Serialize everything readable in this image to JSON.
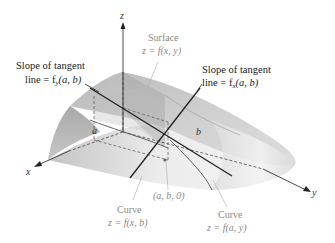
{
  "figure": {
    "axes": {
      "x_label": "x",
      "y_label": "y",
      "z_label": "z"
    },
    "points": {
      "a_label": "a",
      "b_label": "b",
      "base_point_label": "(a, b, 0)"
    },
    "surface": {
      "title": "Surface",
      "equation": "z = f(x, y)"
    },
    "tangent_fy": {
      "line1": "Slope of tangent",
      "line2": "line = f",
      "subscript": "y",
      "suffix": "(a, b)"
    },
    "tangent_fx": {
      "line1": "Slope of tangent",
      "line2": "line = f",
      "subscript": "x",
      "suffix": "(a, b)"
    },
    "curve_xb": {
      "title": "Curve",
      "equation": "z = f(x, b)"
    },
    "curve_ay": {
      "title": "Curve",
      "equation": "z = f(a, y)"
    },
    "colors": {
      "surface_light": "#e8e8e8",
      "surface_mid": "#c9c9c9",
      "surface_dark": "#a8a8a8",
      "line": "#222222",
      "label_gray": "#8a8a8a"
    }
  }
}
